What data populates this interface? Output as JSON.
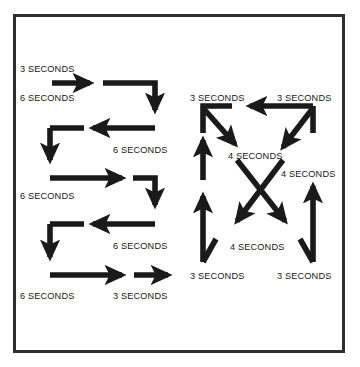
{
  "figure": {
    "background_color": "#ffffff",
    "frame_color": "#2e2e2e",
    "arrow_color": "#1a1a1a",
    "text_color": "#171717"
  },
  "diagrams": [
    {
      "name": "serpentine-pattern",
      "labels": [
        {
          "id": "left-1",
          "text": "3 SECONDS",
          "x": 20,
          "y": 63
        },
        {
          "id": "left-2",
          "text": "6 SECONDS",
          "x": 20,
          "y": 92
        },
        {
          "id": "left-3",
          "text": "6 SECONDS",
          "x": 113,
          "y": 144
        },
        {
          "id": "left-4",
          "text": "6 SECONDS",
          "x": 20,
          "y": 190
        },
        {
          "id": "left-5",
          "text": "6 SECONDS",
          "x": 113,
          "y": 240
        },
        {
          "id": "left-6",
          "text": "6 SECONDS",
          "x": 20,
          "y": 290
        },
        {
          "id": "left-7",
          "text": "3 SECONDS",
          "x": 113,
          "y": 290
        }
      ]
    },
    {
      "name": "star-crossing-pattern",
      "labels": [
        {
          "id": "right-1",
          "text": "3 SECONDS",
          "x": 190,
          "y": 92
        },
        {
          "id": "right-2",
          "text": "3 SECONDS",
          "x": 277,
          "y": 92
        },
        {
          "id": "right-3",
          "text": "4 SECONDS",
          "x": 228,
          "y": 150
        },
        {
          "id": "right-4",
          "text": "4 SECONDS",
          "x": 281,
          "y": 168
        },
        {
          "id": "right-5",
          "text": "4 SECONDS",
          "x": 230,
          "y": 241
        },
        {
          "id": "right-6",
          "text": "3 SECONDS",
          "x": 190,
          "y": 270
        },
        {
          "id": "right-7",
          "text": "3 SECONDS",
          "x": 277,
          "y": 270
        }
      ]
    }
  ]
}
